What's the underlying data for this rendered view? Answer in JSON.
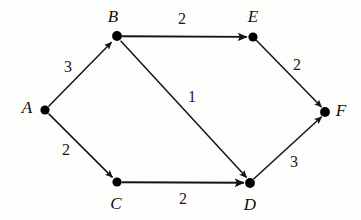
{
  "diagram": {
    "type": "directed-weighted-graph",
    "background_color": "#fdfdfc",
    "stroke_color": "#141414",
    "node_fill_color": "#000000",
    "label_color": "#0d0d0d",
    "nodes": [
      {
        "id": "A",
        "label": "A",
        "cx": 45,
        "cy": 110,
        "r": 4.6,
        "label_x": 27,
        "label_y": 107
      },
      {
        "id": "B",
        "label": "B",
        "cx": 117,
        "cy": 36,
        "r": 4.8,
        "label_x": 113,
        "label_y": 16
      },
      {
        "id": "C",
        "label": "C",
        "cx": 117,
        "cy": 182,
        "r": 4.6,
        "label_x": 116,
        "label_y": 203
      },
      {
        "id": "D",
        "label": "D",
        "cx": 250,
        "cy": 183,
        "r": 4.8,
        "label_x": 250,
        "label_y": 204
      },
      {
        "id": "E",
        "label": "E",
        "cx": 253,
        "cy": 37,
        "r": 4.6,
        "label_x": 253,
        "label_y": 16
      },
      {
        "id": "F",
        "label": "F",
        "cx": 325,
        "cy": 112,
        "r": 4.8,
        "label_x": 341,
        "label_y": 110
      }
    ],
    "edges": [
      {
        "id": "A-B",
        "from": "A",
        "to": "B",
        "weight": "3",
        "weight_x": 68,
        "weight_y": 67
      },
      {
        "id": "A-C",
        "from": "A",
        "to": "C",
        "weight": "2",
        "weight_x": 66,
        "weight_y": 150
      },
      {
        "id": "B-E",
        "from": "B",
        "to": "E",
        "weight": "2",
        "weight_x": 182,
        "weight_y": 19
      },
      {
        "id": "B-D",
        "from": "B",
        "to": "D",
        "weight": "1",
        "weight_x": 192,
        "weight_y": 97
      },
      {
        "id": "C-D",
        "from": "C",
        "to": "D",
        "weight": "2",
        "weight_x": 183,
        "weight_y": 199
      },
      {
        "id": "E-F",
        "from": "E",
        "to": "F",
        "weight": "2",
        "weight_x": 297,
        "weight_y": 65
      },
      {
        "id": "D-F",
        "from": "D",
        "to": "F",
        "weight": "3",
        "weight_x": 294,
        "weight_y": 162
      }
    ]
  }
}
